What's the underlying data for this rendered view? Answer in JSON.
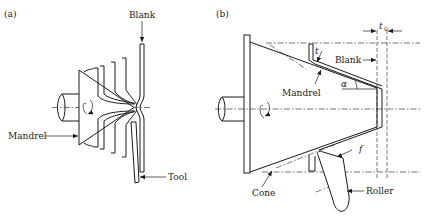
{
  "figure": {
    "panel_a": {
      "label": "(a)",
      "annotations": {
        "blank": "Blank",
        "mandrel": "Mandrel",
        "tool": "Tool"
      }
    },
    "panel_b": {
      "label": "(b)",
      "annotations": {
        "t0": "t",
        "t0_sub": "0",
        "t": "t",
        "blank": "Blank",
        "alpha": "α",
        "mandrel": "Mandrel",
        "f": "f",
        "cone": "Cone",
        "roller": "Roller"
      }
    }
  }
}
